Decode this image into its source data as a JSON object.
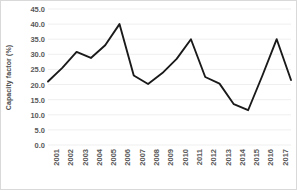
{
  "chart_data": {
    "type": "line",
    "title": "",
    "xlabel": "",
    "ylabel": "Capacity factor (%)",
    "ylim": [
      0.0,
      45.0
    ],
    "ytick_step": 5.0,
    "yticks": [
      "45.0",
      "40.0",
      "35.0",
      "30.0",
      "25.0",
      "20.0",
      "15.0",
      "10.0",
      "5.0",
      "0.0"
    ],
    "grid": true,
    "legend": "none",
    "line_color": "#1a1a1a",
    "gridline_color": "#efefef",
    "categories": [
      "2001",
      "2002",
      "2003",
      "2004",
      "2005",
      "2006",
      "2007",
      "2008",
      "2009",
      "2010",
      "2011",
      "2012",
      "2013",
      "2014",
      "2015",
      "2016",
      "2017",
      "2018"
    ],
    "values": [
      21.0,
      25.5,
      30.8,
      28.8,
      33.0,
      40.0,
      23.0,
      20.2,
      23.8,
      28.5,
      35.0,
      22.5,
      20.3,
      13.5,
      11.5,
      23.0,
      35.0,
      21.5
    ]
  }
}
